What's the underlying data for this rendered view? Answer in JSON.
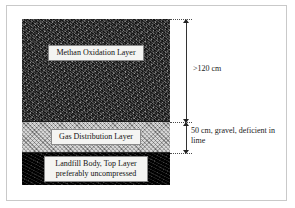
{
  "figure": {
    "frame_color": "#c9c9c9",
    "background": "#ffffff"
  },
  "diagram": {
    "type": "cross-section",
    "layers": [
      {
        "id": "methane-oxidation-layer",
        "label": "Methan Oxidation Layer",
        "fill": "#5c5c5c",
        "texture": "mottled-soil",
        "order": 1
      },
      {
        "id": "gas-distribution-layer",
        "label": "Gas Distribution Layer",
        "fill": "#b0b0b0",
        "texture": "gravel-hatch",
        "order": 2
      },
      {
        "id": "landfill-body-layer",
        "label_line1": "Landfill Body, Top Layer",
        "label_line2": "preferably uncompressed",
        "fill": "#0d0d0d",
        "texture": "dark-waste",
        "order": 3
      }
    ]
  },
  "dimensions": [
    {
      "id": "upper-dimension",
      "text": ">120 cm",
      "spans": "Methan Oxidation Layer"
    },
    {
      "id": "lower-dimension",
      "text": "50 cm, gravel, deficient in lime",
      "spans": "Gas Distribution Layer"
    }
  ]
}
